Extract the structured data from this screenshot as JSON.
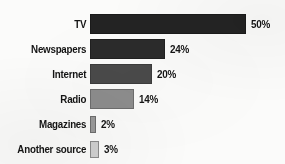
{
  "chart_data": {
    "type": "bar",
    "orientation": "horizontal",
    "title": "",
    "subtitle": "",
    "xlabel": "",
    "ylabel": "",
    "xlim": [
      0,
      50
    ],
    "grid": false,
    "legend": null,
    "value_suffix": "%",
    "categories": [
      "TV",
      "Newspapers",
      "Internet",
      "Radio",
      "Magazines",
      "Another source"
    ],
    "values": [
      50,
      24,
      20,
      14,
      2,
      3
    ],
    "value_labels": [
      "50%",
      "24%",
      "20%",
      "14%",
      "2%",
      "3%"
    ],
    "bar_colors": [
      "#232323",
      "#2b2b2b",
      "#4a4a4a",
      "#8d8d8d",
      "#9a9a9a",
      "#cfcfcf"
    ],
    "bar_border_colors": [
      "#1a1a1a",
      "#202020",
      "#3c3c3c",
      "#6d6d6d",
      "#6e6e6e",
      "#8a8a8a"
    ],
    "bars": [
      {
        "label": "TV",
        "value": 50,
        "value_label": "50%",
        "color": "#232323",
        "border": "#1a1a1a"
      },
      {
        "label": "Newspapers",
        "value": 24,
        "value_label": "24%",
        "color": "#2b2b2b",
        "border": "#202020"
      },
      {
        "label": "Internet",
        "value": 20,
        "value_label": "20%",
        "color": "#4a4a4a",
        "border": "#3c3c3c"
      },
      {
        "label": "Radio",
        "value": 14,
        "value_label": "14%",
        "color": "#8d8d8d",
        "border": "#6d6d6d"
      },
      {
        "label": "Magazines",
        "value": 2,
        "value_label": "2%",
        "color": "#9a9a9a",
        "border": "#6e6e6e"
      },
      {
        "label": "Another source",
        "value": 3,
        "value_label": "3%",
        "color": "#cfcfcf",
        "border": "#8a8a8a"
      }
    ]
  },
  "style": {
    "background": "#fbfbfa",
    "text_color": "#141414"
  }
}
